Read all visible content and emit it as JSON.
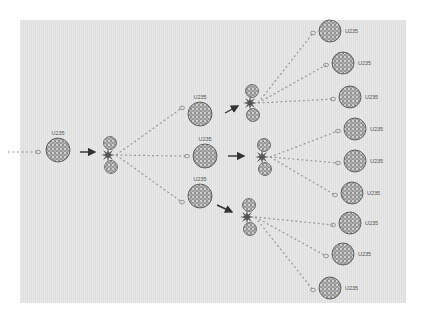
{
  "diagram": {
    "title": "",
    "type": "nuclear-fission-chain-reaction",
    "colors": {
      "background": "#ffffff",
      "panel": "#e3e3e3",
      "nucleus_fill": "#8a8a8a",
      "nucleus_edge": "#4a4a4a",
      "neutron_trail": "#9a9a9a",
      "arrow": "#333333",
      "label": "#555555"
    },
    "stages": {
      "incoming_neutron": {
        "label": ""
      },
      "generation_1": [
        {
          "id": "u1",
          "label": "U235",
          "x": 58,
          "y": 150,
          "r": 12
        }
      ],
      "generation_2": [
        {
          "id": "u2a",
          "label": "U235",
          "x": 200,
          "y": 114,
          "r": 12
        },
        {
          "id": "u2b",
          "label": "U235",
          "x": 205,
          "y": 156,
          "r": 12
        },
        {
          "id": "u2c",
          "label": "U235",
          "x": 200,
          "y": 196,
          "r": 12
        }
      ],
      "generation_3": [
        {
          "id": "u3a",
          "label": "U235",
          "x": 330,
          "y": 31,
          "r": 11
        },
        {
          "id": "u3b",
          "label": "U235",
          "x": 343,
          "y": 63,
          "r": 11
        },
        {
          "id": "u3c",
          "label": "U235",
          "x": 350,
          "y": 97,
          "r": 11
        },
        {
          "id": "u3d",
          "label": "U235",
          "x": 355,
          "y": 129,
          "r": 11
        },
        {
          "id": "u3e",
          "label": "U235",
          "x": 355,
          "y": 161,
          "r": 11
        },
        {
          "id": "u3f",
          "label": "U235",
          "x": 352,
          "y": 193,
          "r": 11
        },
        {
          "id": "u3g",
          "label": "U235",
          "x": 350,
          "y": 223,
          "r": 11
        },
        {
          "id": "u3h",
          "label": "U235",
          "x": 343,
          "y": 254,
          "r": 11
        },
        {
          "id": "u3i",
          "label": "U235",
          "x": 330,
          "y": 288,
          "r": 11
        }
      ],
      "fission_events": [
        {
          "id": "f1",
          "x": 108,
          "y": 155
        },
        {
          "id": "f2a",
          "x": 250,
          "y": 103
        },
        {
          "id": "f2b",
          "x": 262,
          "y": 157
        },
        {
          "id": "f2c",
          "x": 247,
          "y": 217
        }
      ]
    }
  }
}
